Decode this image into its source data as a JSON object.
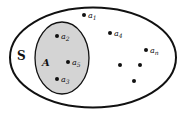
{
  "diagram": {
    "type": "venn",
    "universal_set": {
      "label": "S",
      "fill": "#ffffff",
      "stroke": "#111111"
    },
    "subset": {
      "label": "A",
      "fill": "#d4d4d4",
      "stroke": "#111111"
    },
    "elements_in_A": [
      {
        "label": "a",
        "sub": "2"
      },
      {
        "label": "a",
        "sub": "5"
      },
      {
        "label": "a",
        "sub": "3"
      }
    ],
    "elements_outside_A": [
      {
        "label": "a",
        "sub": "1"
      },
      {
        "label": "a",
        "sub": "4"
      },
      {
        "label": "a",
        "sub": "n"
      }
    ],
    "unlabeled_points": 3
  }
}
